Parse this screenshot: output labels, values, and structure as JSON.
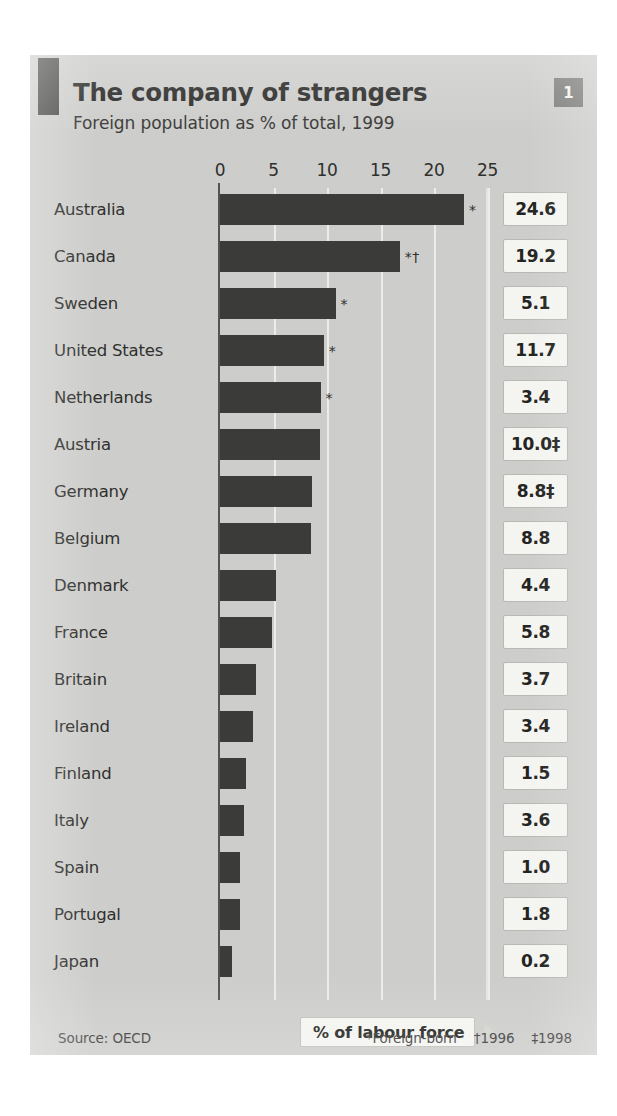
{
  "figure": {
    "badge": "1",
    "title": "The company of strangers",
    "subtitle": "Foreign population as % of total, 1999",
    "source": "Source: OECD",
    "callout": "% of labour force",
    "footnotes": [
      "*Foreign-born",
      "†1996",
      "‡1998"
    ],
    "colors": {
      "panel_background": "#cdcdcb",
      "bar": "#3b3b39",
      "axis": "#55554f",
      "gridline": "#ececea",
      "value_box": "#f4f4f1",
      "badge": "#7c7c79",
      "corner_mark": "#4a4a48",
      "text": "#2f2f2d"
    }
  },
  "chart_data": {
    "type": "bar",
    "orientation": "horizontal",
    "title": "The company of strangers",
    "subtitle": "Foreign population as % of total, 1999",
    "xlabel": "",
    "ylabel": "",
    "xlim": [
      0,
      25
    ],
    "xticks": [
      0,
      5,
      10,
      15,
      20,
      25
    ],
    "xtick_labels": [
      "0",
      "5",
      "10",
      "15",
      "20",
      "25"
    ],
    "grid": true,
    "legend": null,
    "source": "Source: OECD",
    "categories": [
      "Australia",
      "Canada",
      "Sweden",
      "United States",
      "Netherlands",
      "Austria",
      "Germany",
      "Belgium",
      "Denmark",
      "France",
      "Britain",
      "Ireland",
      "Finland",
      "Italy",
      "Spain",
      "Portugal",
      "Japan"
    ],
    "values": [
      22.8,
      16.8,
      10.8,
      9.7,
      9.4,
      9.3,
      8.6,
      8.5,
      5.2,
      4.9,
      3.4,
      3.1,
      2.4,
      2.2,
      1.9,
      1.9,
      1.1
    ],
    "data_labels": [
      "24.6",
      "19.2",
      "5.1",
      "11.7",
      "3.4",
      "10.0‡",
      "8.8‡",
      "8.8",
      "4.4",
      "5.8",
      "3.7",
      "3.4",
      "1.5",
      "3.6",
      "1.0",
      "1.8",
      "0.2"
    ],
    "annotations": [
      "*",
      "*†",
      "*",
      "*",
      "*",
      "",
      "",
      "",
      "",
      "",
      "",
      "",
      "",
      "",
      "",
      "",
      ""
    ]
  }
}
